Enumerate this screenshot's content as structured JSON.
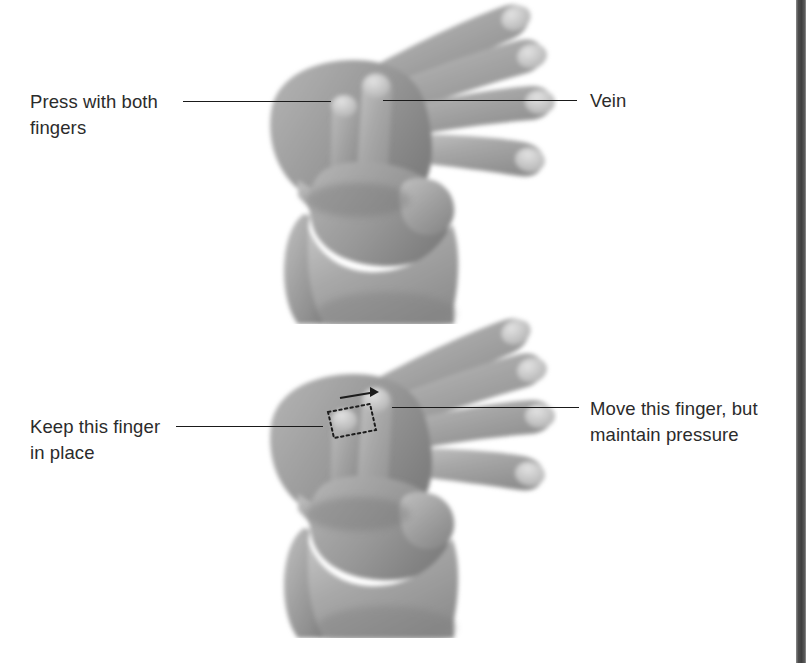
{
  "page": {
    "background_color": "#ffffff",
    "width": 811,
    "height": 663,
    "edge_color": "#4d4d4d"
  },
  "text_color": "#2b2b2b",
  "leader_line_color": "#1a1a1a",
  "figures": [
    {
      "id": "figure-top",
      "name": "two-finger-vein-compression",
      "description": "Hand with two fingers of the opposite hand pressing on a vein on the back of the hand"
    },
    {
      "id": "figure-bottom",
      "name": "finger-slide-maintaining-pressure",
      "description": "Same hand position; one finger slides along the vein while the other stays in place, dotted outline shows the movement"
    }
  ],
  "callouts": [
    {
      "id": "callout-press-with-both-fingers",
      "name": "press-with-both-fingers",
      "text": "Press with both\nfingers",
      "side": "left",
      "figure": "figure-top"
    },
    {
      "id": "callout-vein",
      "name": "vein",
      "text": "Vein",
      "side": "right",
      "figure": "figure-top"
    },
    {
      "id": "callout-keep-this-finger-in-place",
      "name": "keep-this-finger-in-place",
      "text": "Keep this finger\nin place",
      "side": "left",
      "figure": "figure-bottom"
    },
    {
      "id": "callout-move-this-finger",
      "name": "move-this-finger-but-maintain-pressure",
      "text": "Move this finger, but\nmaintain pressure",
      "side": "right",
      "figure": "figure-bottom"
    }
  ]
}
